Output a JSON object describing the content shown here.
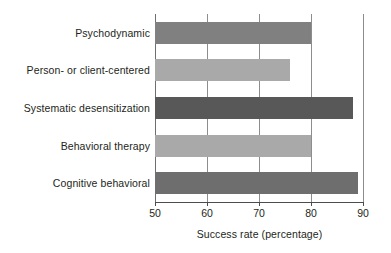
{
  "chart_data": {
    "type": "bar",
    "orientation": "horizontal",
    "title": "",
    "xlabel": "Success rate (percentage)",
    "ylabel": "",
    "xlim": [
      50,
      90
    ],
    "xticks": [
      50,
      60,
      70,
      80,
      90
    ],
    "xtick_labels": [
      "50",
      "60",
      "70",
      "80",
      "90"
    ],
    "grid": "vertical",
    "legend": "none",
    "categories": [
      "Psychodynamic",
      "Person- or client-centered",
      "Systematic desensitization",
      "Behavioral therapy",
      "Cognitive behavioral"
    ],
    "values": [
      80,
      76,
      88,
      80,
      89
    ],
    "bar_colors": [
      "#808080",
      "#a9a9a9",
      "#585858",
      "#a9a9a9",
      "#6e6e6e"
    ],
    "background": "#ffffff",
    "axis_color": "#4d4d4d",
    "gridline_color": "#8d8d8d",
    "text_color": "#231f20"
  }
}
